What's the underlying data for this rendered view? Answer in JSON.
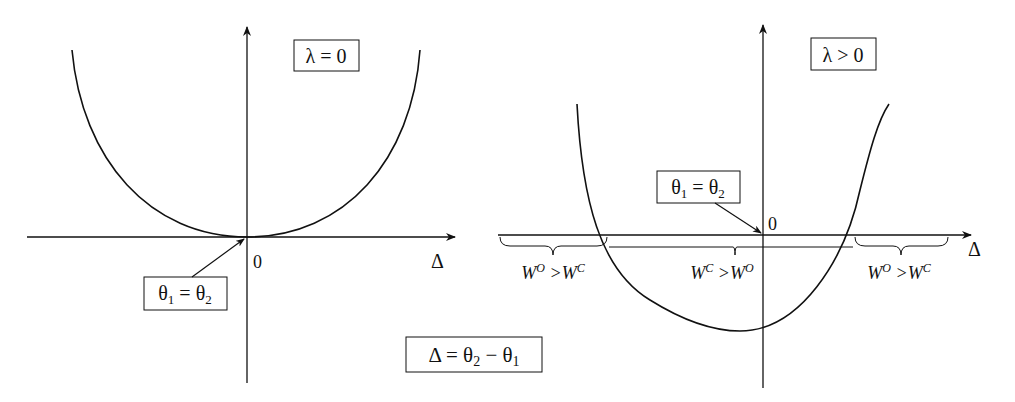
{
  "left_panel": {
    "condition_label": "λ = 0",
    "origin_label": "0",
    "x_axis_label": "Δ",
    "vertex_annotation": {
      "theta": "θ",
      "sub1": "1",
      "eq": " = ",
      "sub2": "2"
    }
  },
  "right_panel": {
    "condition_label": "λ > 0",
    "origin_label": "0",
    "x_axis_label": "Δ",
    "vertex_annotation": {
      "theta": "θ",
      "sub1": "1",
      "eq": " = ",
      "sub2": "2"
    },
    "regions": [
      {
        "a": "W",
        "a_sup": "O",
        "op": " >",
        "b": "W",
        "b_sup": "C"
      },
      {
        "a": "W",
        "a_sup": "C",
        "op": " >",
        "b": "W",
        "b_sup": "O"
      },
      {
        "a": "W",
        "a_sup": "O",
        "op": " >",
        "b": "W",
        "b_sup": "C"
      }
    ]
  },
  "definition": {
    "delta": "Δ",
    "eq": " = ",
    "theta": "θ",
    "sub2": "2",
    "minus": " − ",
    "sub1": "1"
  }
}
